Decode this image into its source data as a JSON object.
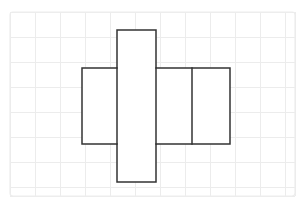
{
  "canvas": {
    "width": 306,
    "height": 206,
    "background_color": "#ffffff"
  },
  "grid": {
    "visible": true,
    "line_color": "#ececec",
    "frame_color": "#ededed",
    "cell_size": 25,
    "frame": {
      "x": 10,
      "y": 12,
      "width": 285,
      "height": 184
    },
    "vertical_lines": [
      10,
      35,
      60,
      85,
      110,
      135,
      160,
      185,
      210,
      235,
      260,
      285,
      295
    ],
    "horizontal_lines": [
      12,
      37,
      62,
      87,
      112,
      137,
      162,
      187,
      196
    ]
  },
  "figure": {
    "name": "net-of-rectangular-prism",
    "stroke_color": "#333333",
    "stroke_width": 1.5,
    "fill_color": "#ffffff",
    "band": {
      "left": 82,
      "top": 68,
      "right": 230,
      "bottom": 144
    },
    "vertical_fold_lines": [
      117,
      156,
      192
    ],
    "faces": [
      {
        "name": "left-side-face",
        "x": 82,
        "y": 68,
        "width": 35,
        "height": 76
      },
      {
        "name": "front-face",
        "x": 117,
        "y": 68,
        "width": 39,
        "height": 76
      },
      {
        "name": "right-side-face",
        "x": 156,
        "y": 68,
        "width": 36,
        "height": 76
      },
      {
        "name": "back-face",
        "x": 192,
        "y": 68,
        "width": 38,
        "height": 76
      },
      {
        "name": "top-flap-face",
        "x": 117,
        "y": 30,
        "width": 39,
        "height": 38
      },
      {
        "name": "bottom-flap-face",
        "x": 117,
        "y": 144,
        "width": 39,
        "height": 38
      }
    ],
    "outline_path": "M 117 30 L 156 30 L 156 68 L 230 68 L 230 144 L 156 144 L 156 182 L 117 182 L 117 144 L 82 144 L 82 68 L 117 68 Z"
  }
}
